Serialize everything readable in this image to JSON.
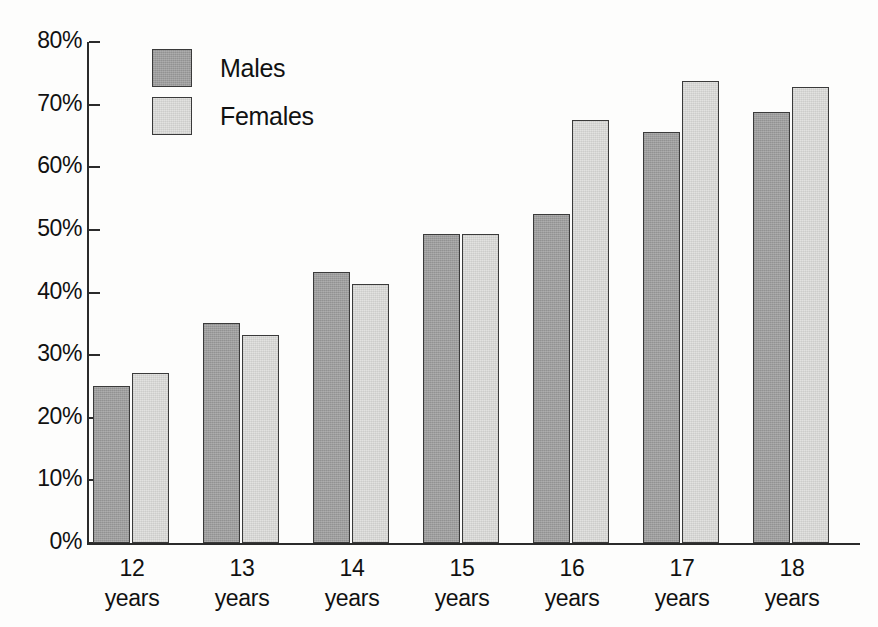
{
  "chart_data": {
    "type": "bar",
    "title": "",
    "xlabel": "",
    "ylabel": "",
    "ylim": [
      0,
      80
    ],
    "grid": false,
    "legend_position": "top-left inside plot area",
    "categories": [
      "12 years",
      "13 years",
      "14 years",
      "15 years",
      "16 years",
      "17 years",
      "18 years"
    ],
    "category_numbers": [
      "12",
      "13",
      "14",
      "15",
      "16",
      "17",
      "18"
    ],
    "category_unit": "years",
    "ytick_labels": [
      "80%",
      "70%",
      "60%",
      "50%",
      "40%",
      "30%",
      "20%",
      "10%",
      "0%"
    ],
    "ytick_values": [
      80,
      70,
      60,
      50,
      40,
      30,
      20,
      10,
      0
    ],
    "series": [
      {
        "name": "Males",
        "color": "#9d9d9d",
        "values": [
          25.0,
          35.2,
          43.3,
          49.4,
          52.6,
          65.7,
          68.8
        ]
      },
      {
        "name": "Females",
        "color": "#e2e2e0",
        "values": [
          27.1,
          33.2,
          41.3,
          49.4,
          67.6,
          73.7,
          72.8
        ]
      }
    ]
  },
  "legend": {
    "items": [
      {
        "label": "Males"
      },
      {
        "label": "Females"
      }
    ]
  },
  "caption": {
    "text": ""
  }
}
